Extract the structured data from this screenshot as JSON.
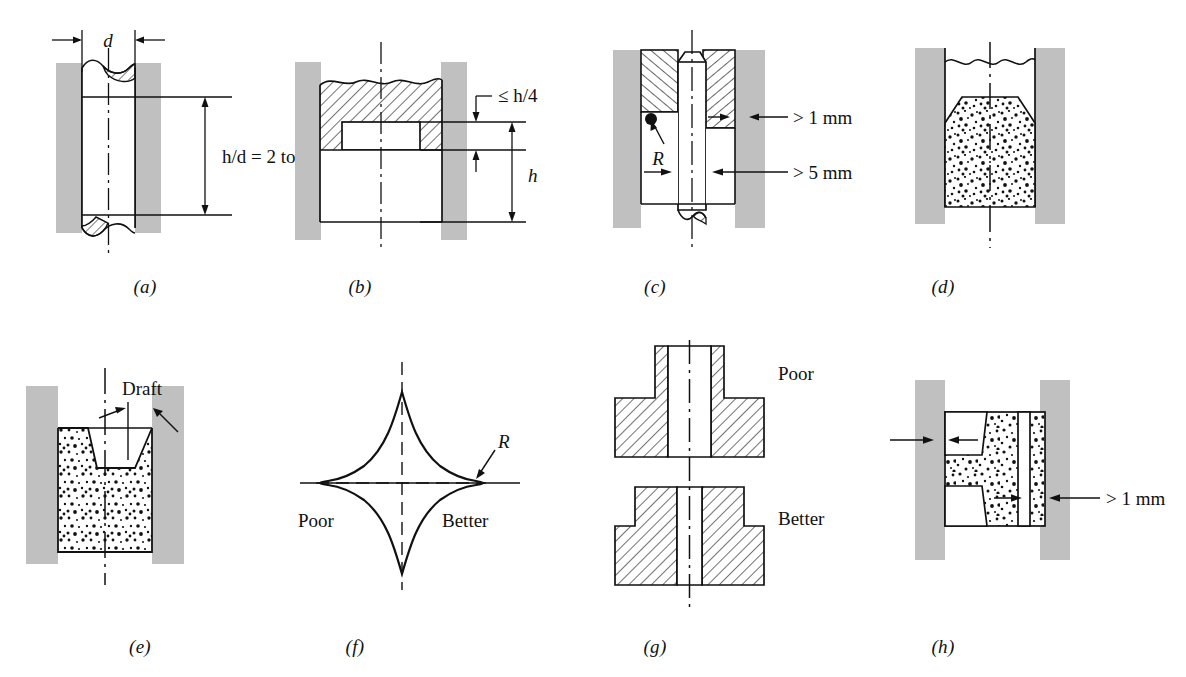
{
  "figure": {
    "background_color": "#ffffff",
    "line_color": "#111111",
    "die_wall_color": "#c0c0c0",
    "powder_fill_color": "#ffffff",
    "panel_count": 8
  },
  "panels": [
    {
      "id": "a",
      "caption": "(a)",
      "description": "Tall thin cylindrical cavity between die walls with aspect ratio callout",
      "labels": [
        {
          "name": "diameter-label",
          "text": "d",
          "italic": true
        },
        {
          "name": "aspect-ratio-label",
          "text": "h/d = 2 to 4",
          "italic": true
        }
      ]
    },
    {
      "id": "b",
      "caption": "(b)",
      "description": "Hatched punch with wavy top over a stepped recess, height callouts",
      "labels": [
        {
          "name": "step-height-label",
          "text": "≤ h/4",
          "italic": true
        },
        {
          "name": "height-label",
          "text": "h",
          "italic": true
        }
      ]
    },
    {
      "id": "c",
      "caption": "(c)",
      "description": "Core rod in chevron-hatched die with minimum wall thickness callouts",
      "labels": [
        {
          "name": "radius-label",
          "text": "R",
          "italic": true
        },
        {
          "name": "min-wall-1mm-label",
          "text": "> 1 mm",
          "italic": false
        },
        {
          "name": "min-wall-5mm-label",
          "text": "> 5 mm",
          "italic": false
        }
      ]
    },
    {
      "id": "d",
      "caption": "(d)",
      "description": "Powder-filled die cavity with tapered shoulder top, wavy break line above",
      "labels": []
    },
    {
      "id": "e",
      "caption": "(e)",
      "description": "Powder compact with tapered V-groove showing draft angle",
      "labels": [
        {
          "name": "draft-label",
          "text": "Draft",
          "italic": false
        }
      ]
    },
    {
      "id": "f",
      "caption": "(f)",
      "description": "Four-pointed star profile comparing sharp corner to radiused corner",
      "labels": [
        {
          "name": "poor-label",
          "text": "Poor",
          "italic": false
        },
        {
          "name": "better-label",
          "text": "Better",
          "italic": false
        },
        {
          "name": "radius-label",
          "text": "R",
          "italic": true
        }
      ]
    },
    {
      "id": "g",
      "caption": "(g)",
      "description": "Two hatched flanged hub cross sections compared",
      "labels": [
        {
          "name": "poor-label",
          "text": "Poor",
          "italic": false
        },
        {
          "name": "better-label",
          "text": "Better",
          "italic": false
        }
      ]
    },
    {
      "id": "h",
      "caption": "(h)",
      "description": "Powder compact with side notches and thin outer wall callout",
      "labels": [
        {
          "name": "min-wall-1mm-label",
          "text": "> 1 mm",
          "italic": false
        }
      ]
    }
  ]
}
